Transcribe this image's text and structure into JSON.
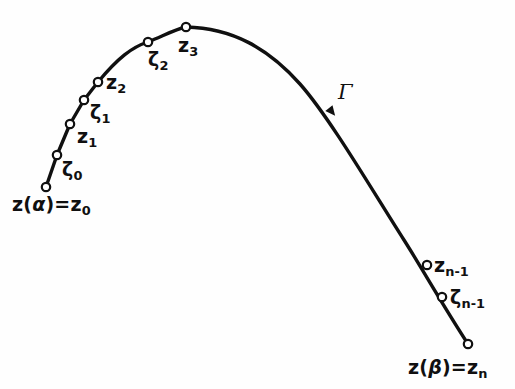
{
  "figure": {
    "background_color": "#fefefe",
    "ink_color": "#101010",
    "width": 515,
    "height": 389,
    "curve_name": "Γ",
    "curve_stroke_width": 3.4,
    "marker_radius": 4.2,
    "marker_fill": "#ffffff",
    "marker_stroke": "#101010",
    "marker_stroke_width": 2.2
  },
  "chart_data": {
    "type": "line",
    "title": "",
    "xlabel": "",
    "ylabel": "",
    "grid": false,
    "legend": "none",
    "xlim": [
      0,
      515
    ],
    "ylim": [
      389,
      0
    ],
    "orientation": "left-to-right along curve, arrow at Γ",
    "curve_path": "M 46 187 L 57 155 L 70 124 L 84 100 L 98 82 C 118 58 132 47 148 42 C 165 35 176 29 186 27 C 232 28 268 48 300 84 C 330 118 372 190 404 240 C 420 265 442 304 468 344",
    "series": [
      {
        "name": "Γ",
        "points": [
          {
            "label": "z_0",
            "x": 46,
            "y": 187,
            "kind": "z"
          },
          {
            "label": "ζ_0",
            "x": 57,
            "y": 155,
            "kind": "zeta"
          },
          {
            "label": "z_1",
            "x": 70,
            "y": 124,
            "kind": "z"
          },
          {
            "label": "ζ_1",
            "x": 84,
            "y": 100,
            "kind": "zeta"
          },
          {
            "label": "z_2",
            "x": 98,
            "y": 82,
            "kind": "z"
          },
          {
            "label": "ζ_2",
            "x": 148,
            "y": 42,
            "kind": "zeta"
          },
          {
            "label": "z_3",
            "x": 186,
            "y": 27,
            "kind": "z"
          },
          {
            "label": "z_{n-1}",
            "x": 427,
            "y": 265,
            "kind": "z"
          },
          {
            "label": "ζ_{n-1}",
            "x": 442,
            "y": 297,
            "kind": "zeta"
          },
          {
            "label": "z_n",
            "x": 468,
            "y": 344,
            "kind": "z"
          }
        ]
      }
    ],
    "arrow": {
      "x": 332,
      "y": 112,
      "direction": "down-right"
    }
  },
  "labels": {
    "start": {
      "base": "z",
      "open_paren": "(",
      "parameter": "α",
      "close_paren": ")",
      "equals": "=",
      "result_base": "z",
      "result_sub": "0",
      "x": 12,
      "y": 195
    },
    "end": {
      "base": "z",
      "open_paren": "(",
      "parameter": "β",
      "close_paren": ")",
      "equals": "=",
      "result_base": "z",
      "result_sub": "n",
      "x": 408,
      "y": 358
    },
    "zeta_0": {
      "glyph": "ζ",
      "sub": "0",
      "x": 62,
      "y": 160
    },
    "z_1": {
      "glyph": "z",
      "sub": "1",
      "x": 77,
      "y": 127
    },
    "zeta_1": {
      "glyph": "ζ",
      "sub": "1",
      "x": 90,
      "y": 103
    },
    "z_2": {
      "glyph": "z",
      "sub": "2",
      "x": 106,
      "y": 73
    },
    "zeta_2": {
      "glyph": "ζ",
      "sub": "2",
      "x": 148,
      "y": 50
    },
    "z_3": {
      "glyph": "z",
      "sub": "3",
      "x": 178,
      "y": 36
    },
    "z_n_minus_1": {
      "glyph": "z",
      "sub": "n-1",
      "x": 434,
      "y": 256
    },
    "zeta_n_minus_1": {
      "glyph": "ζ",
      "sub": "n-1",
      "x": 450,
      "y": 288
    },
    "gamma": {
      "glyph": "Γ",
      "x": 338,
      "y": 82
    }
  }
}
